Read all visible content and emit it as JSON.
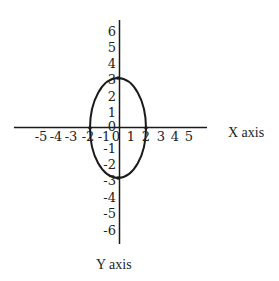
{
  "diagram": {
    "type": "ellipse-on-coordinate-plane",
    "x_axis_label": "X axis",
    "y_axis_label": "Y axis",
    "x_ticks": [
      "-5",
      "-4",
      "-3",
      "-2",
      "-1",
      "0",
      "1",
      "2",
      "3",
      "4",
      "5"
    ],
    "y_ticks_positive": [
      "6",
      "5",
      "4",
      "3",
      "2",
      "1"
    ],
    "origin_label": "0",
    "y_ticks_negative": [
      "-1",
      "-2",
      "-3",
      "-4",
      "-5",
      "-6"
    ],
    "ellipse": {
      "center": [
        0,
        0
      ],
      "x_radius": 2,
      "y_radius": 3,
      "intercepts": [
        "(-2,0)",
        "(2,0)",
        "(0,3)",
        "(0,-3)"
      ]
    },
    "stroke_color": "#1a1a1a",
    "background_color": "#ffffff"
  }
}
